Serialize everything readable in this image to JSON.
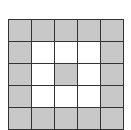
{
  "grid": {
    "rows": 5,
    "cols": 5,
    "colors": {
      "filled": "#c8c8c8",
      "empty": "#ffffff",
      "line": "#333333"
    },
    "cells": [
      [
        1,
        1,
        1,
        1,
        1
      ],
      [
        1,
        0,
        0,
        0,
        1
      ],
      [
        1,
        0,
        1,
        0,
        1
      ],
      [
        1,
        0,
        0,
        0,
        1
      ],
      [
        1,
        1,
        1,
        1,
        1
      ]
    ]
  }
}
